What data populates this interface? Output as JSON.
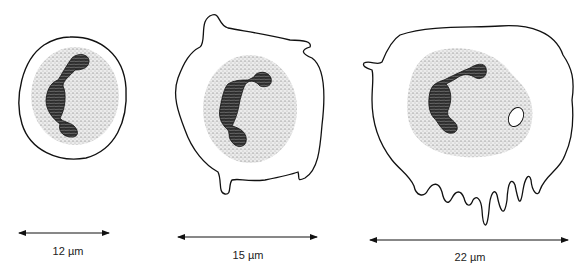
{
  "figure": {
    "colors": {
      "line": "#111111",
      "stipple": "#c9c9c9",
      "nucleus": "#3a3a3a",
      "background": "#ffffff"
    },
    "cells": [
      {
        "id": "cell-1",
        "scale_label": "12 µm"
      },
      {
        "id": "cell-2",
        "scale_label": "15 µm"
      },
      {
        "id": "cell-3",
        "scale_label": "22 µm"
      }
    ]
  }
}
